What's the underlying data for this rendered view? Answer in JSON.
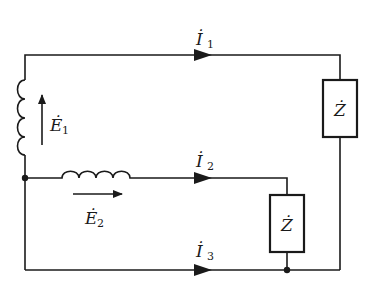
{
  "diagram": {
    "type": "circuit",
    "colors": {
      "line": "#1a1a1a",
      "background": "#ffffff"
    },
    "currents": [
      {
        "symbol": "İ",
        "subscript": "1"
      },
      {
        "symbol": "İ",
        "subscript": "2"
      },
      {
        "symbol": "İ",
        "subscript": "3"
      }
    ],
    "sources": [
      {
        "symbol": "Ė",
        "subscript": "1",
        "direction": "up"
      },
      {
        "symbol": "Ė",
        "subscript": "2",
        "direction": "right"
      }
    ],
    "impedances": [
      {
        "symbol": "Ż"
      },
      {
        "symbol": "Ż"
      }
    ]
  }
}
